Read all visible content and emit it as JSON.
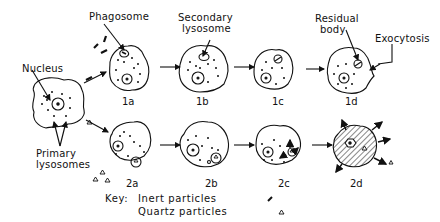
{
  "labels": {
    "nucleus": "Nucleus",
    "primary_lysosomes": [
      "Primary",
      "lysosomes"
    ],
    "phagosome": "Phagosome",
    "secondary_lysosome": [
      "Secondary",
      "lysosome"
    ],
    "residual_body": [
      "Residual",
      "body"
    ],
    "exocytosis": "Exocytosis"
  },
  "stages": {
    "row1": [
      "1a",
      "1b",
      "1c",
      "1d"
    ],
    "row2": [
      "2a",
      "2b",
      "2c",
      "2d"
    ]
  },
  "key": {
    "title": "Key:",
    "inert": "Inert particles",
    "quartz": "Quartz particles",
    "inert_symbol": "/",
    "quartz_symbol": "Δ"
  },
  "colors": {
    "ink": "#111111",
    "background": "#ffffff"
  }
}
